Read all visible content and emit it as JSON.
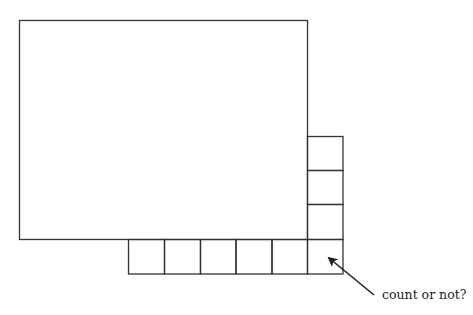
{
  "diagram": {
    "type": "grid-counting-figure",
    "stroke_color": "#333333",
    "background": "#ffffff",
    "main_rectangle": {
      "x": 19,
      "y": 20,
      "width": 288,
      "height": 219
    },
    "unit_square_size": 35,
    "right_column": {
      "count": 3,
      "x": 307,
      "y_start": 136
    },
    "bottom_row": {
      "count": 5,
      "x_start": 128,
      "y": 239
    },
    "corner_square": {
      "x": 307,
      "y": 239
    },
    "annotation": {
      "text": "count or not?",
      "points_to": "corner-square"
    }
  }
}
